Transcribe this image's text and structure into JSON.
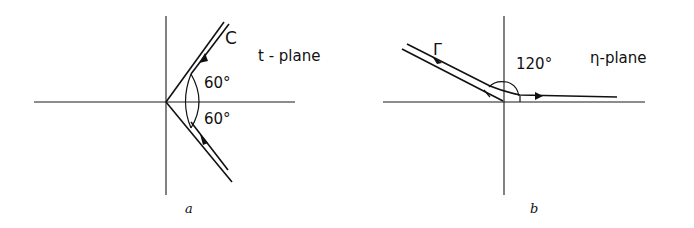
{
  "panels": [
    {
      "id": "a",
      "caption": "a",
      "plane_label": "t - plane",
      "contour_label": "C",
      "angle_labels": [
        "60°",
        "60°"
      ],
      "description": "Wedge contour from infinity at -60° through origin to infinity at +60°"
    },
    {
      "id": "b",
      "caption": "b",
      "plane_label": "η-plane",
      "contour_label": "Γ",
      "angle_labels": [
        "120°"
      ],
      "description": "Contour from infinity in upper-left at 120° through origin along positive real axis"
    }
  ]
}
